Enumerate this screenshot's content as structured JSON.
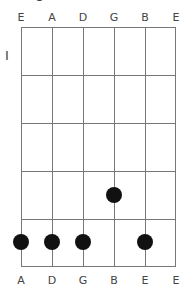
{
  "diagram": {
    "type": "guitar-chord-chart",
    "top_strings": [
      "E",
      "A",
      "D",
      "G",
      "B",
      "E"
    ],
    "bottom_labels": [
      "A",
      "D",
      "G",
      "B",
      "E",
      "E"
    ],
    "fret_marker": "I",
    "num_frets": 5,
    "dots": [
      {
        "string": 0,
        "fret": 5
      },
      {
        "string": 1,
        "fret": 5
      },
      {
        "string": 2,
        "fret": 5
      },
      {
        "string": 3,
        "fret": 4
      },
      {
        "string": 4,
        "fret": 5
      }
    ],
    "colors": {
      "grid": "#777777",
      "dot": "#111111",
      "text": "#444444"
    }
  }
}
